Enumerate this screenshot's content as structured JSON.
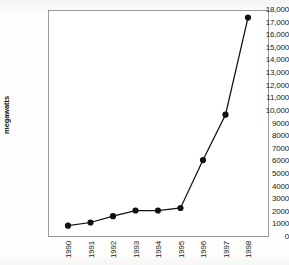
{
  "chart_data": {
    "type": "line",
    "title": "",
    "subtitle": "",
    "xlabel": "",
    "ylabel": "megawatts",
    "categories": [
      "1990",
      "1991",
      "1992",
      "1993",
      "1994",
      "1995",
      "1996",
      "1997",
      "1998"
    ],
    "values": [
      900,
      1150,
      1650,
      2100,
      2100,
      2300,
      6100,
      9700,
      17400
    ],
    "series": [
      {
        "name": "megawatts",
        "values": [
          900,
          1150,
          1650,
          2100,
          2100,
          2300,
          6100,
          9700,
          17400
        ]
      }
    ],
    "ylim": [
      0,
      18000
    ],
    "ytick_step": 1000,
    "ytick_labels": [
      "18,000",
      "17,000",
      "16,000",
      "15,000",
      "14,000",
      "13,000",
      "12,000",
      "11,000",
      "10,000",
      "9000",
      "8000",
      "7000",
      "6000",
      "5000",
      "4000",
      "3000",
      "2000",
      "1000",
      "0"
    ],
    "xtick_labels": [
      "1990",
      "1991",
      "1992",
      "1993",
      "1994",
      "1995",
      "1996",
      "1997",
      "1998"
    ],
    "grid": false,
    "legend": false,
    "legend_position": "none",
    "marker": "filled-circle",
    "colors": {
      "line": "#111111",
      "marker": "#111111",
      "frame": "#9a9a9a",
      "plot_background": "#ffffff",
      "page_background": "#fdfdfc",
      "text": "#1a1a1a"
    }
  }
}
